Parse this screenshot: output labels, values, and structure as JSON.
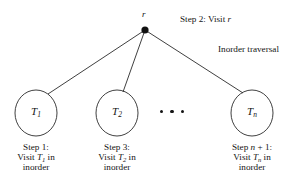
{
  "figure": {
    "background_color": "#ffffff",
    "stroke_color": "#2a2a2a",
    "text_color": "#141414"
  },
  "root": {
    "label": "r",
    "marker": "filled-dot",
    "x": 145,
    "y": 30
  },
  "annotations": [
    {
      "id": "step2",
      "prefix": "Step 2: Visit ",
      "italic": "r",
      "text": "Step 2: Visit r",
      "x": 180,
      "y": 15
    },
    {
      "id": "traversal-title",
      "prefix": "Inorder traversal",
      "italic": "",
      "text": "Inorder traversal",
      "x": 218,
      "y": 45
    }
  ],
  "subtrees": [
    {
      "id": "subtree-1",
      "node_label_base": "T",
      "node_label_sub": "1",
      "node_label": "T1",
      "cx": 36,
      "cy": 113,
      "rx": 21,
      "ry": 23,
      "caption": {
        "line1_prefix": "Step 1:",
        "line1_italic": "",
        "line1_suffix": "",
        "line2_prefix": "Visit ",
        "line2_italic": "T",
        "line2_sub": "1",
        "line2_suffix": " in",
        "line3": "inorder"
      }
    },
    {
      "id": "subtree-2",
      "node_label_base": "T",
      "node_label_sub": "2",
      "node_label": "T2",
      "cx": 117,
      "cy": 113,
      "rx": 21,
      "ry": 23,
      "caption": {
        "line1_prefix": "Step 3:",
        "line1_italic": "",
        "line1_suffix": "",
        "line2_prefix": "Visit ",
        "line2_italic": "T",
        "line2_sub": "2",
        "line2_suffix": " in",
        "line3": "inorder"
      }
    },
    {
      "id": "subtree-n",
      "node_label_base": "T",
      "node_label_sub": "n",
      "node_label": "Tn",
      "cx": 252,
      "cy": 113,
      "rx": 21,
      "ry": 23,
      "caption": {
        "line1_prefix": "Step ",
        "line1_italic": "n",
        "line1_suffix": " + 1:",
        "line2_prefix": "Visit ",
        "line2_italic": "T",
        "line2_sub": "n",
        "line2_suffix": " in",
        "line3": "inorder"
      }
    }
  ],
  "ellipsis": {
    "label": "dots-between-subtrees",
    "count": 3,
    "x": 169,
    "y": 111
  },
  "edges": [
    {
      "id": "edge-root-t1",
      "x1": 145,
      "y1": 30,
      "x2": 48,
      "y2": 94
    },
    {
      "id": "edge-root-t2",
      "x1": 145,
      "y1": 30,
      "x2": 123,
      "y2": 92
    },
    {
      "id": "edge-root-tn",
      "x1": 145,
      "y1": 30,
      "x2": 243,
      "y2": 93
    }
  ]
}
